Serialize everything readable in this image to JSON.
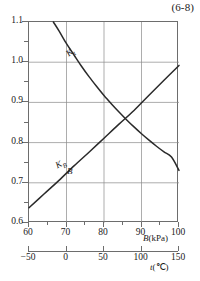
{
  "figure": {
    "equation_tag": "(6-8)",
    "background_color": "#ffffff",
    "line_color": "#2a2a2a",
    "grid_color": "#8a8a8a",
    "frame_color": "#6d6d6d"
  },
  "axes": {
    "y": {
      "label": "",
      "min": 0.6,
      "max": 1.1,
      "major_ticks": [
        0.6,
        0.7,
        0.8,
        0.9,
        1.0,
        1.1
      ],
      "major_tick_labels": [
        "0.6",
        "0.7",
        "0.8",
        "0.9",
        "1.0",
        "1.1"
      ],
      "minor_ticks": [
        0.65,
        0.75,
        0.85,
        0.95,
        1.05
      ],
      "grid": true
    },
    "x_primary": {
      "caption_symbol": "B",
      "caption_unit": "(kPa)",
      "caption_full": "B(kPa)",
      "min": 60,
      "max": 100,
      "major_ticks": [
        60,
        70,
        80,
        90,
        100
      ],
      "major_tick_labels": [
        "60",
        "70",
        "80",
        "90",
        "100"
      ],
      "minor_ticks": [
        65,
        75,
        85,
        95
      ],
      "grid": true
    },
    "x_secondary": {
      "caption_symbol": "t",
      "caption_unit": "(℃)",
      "caption_full": "t(℃)",
      "min": -50,
      "max": 150,
      "major_ticks": [
        -50,
        0,
        50,
        100,
        150
      ],
      "major_tick_labels": [
        "−50",
        "0",
        "50",
        "100",
        "150"
      ],
      "grid": false
    }
  },
  "curve_labels": {
    "descending": {
      "text": "K",
      "sub": "t"
    },
    "ascending_upper": {
      "text": "K",
      "sub": "B"
    },
    "ascending_lower": {
      "text": "B",
      "sub": ""
    }
  },
  "chart_data": {
    "type": "line",
    "title": "(6-8)",
    "xlabel": "B(kPa)",
    "ylabel": "",
    "xlim": [
      60,
      100
    ],
    "ylim": [
      0.6,
      1.1
    ],
    "grid": true,
    "legend": "inline-curve-labels",
    "secondary_xlabel": "t(℃)",
    "secondary_xlim": [
      -50,
      150
    ],
    "series": [
      {
        "name": "Kt",
        "label": "K_t",
        "description": "descending convex correction factor curve",
        "x": [
          66.5,
          68,
          70,
          72,
          74,
          76,
          78,
          80,
          82,
          84,
          86,
          88,
          90,
          92,
          94,
          96,
          98,
          100
        ],
        "y": [
          1.1,
          1.078,
          1.046,
          1.018,
          0.99,
          0.964,
          0.94,
          0.917,
          0.896,
          0.876,
          0.857,
          0.839,
          0.822,
          0.806,
          0.791,
          0.777,
          0.764,
          0.731
        ]
      },
      {
        "name": "KB",
        "label": "K_B / B",
        "description": "ascending slightly concave curve",
        "x": [
          60,
          64,
          68,
          72,
          76,
          80,
          84,
          88,
          92,
          96,
          100
        ],
        "y": [
          0.638,
          0.672,
          0.706,
          0.742,
          0.776,
          0.811,
          0.846,
          0.88,
          0.918,
          0.955,
          0.992
        ]
      }
    ]
  }
}
